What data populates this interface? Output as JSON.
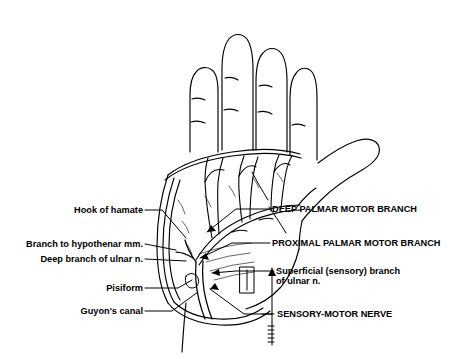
{
  "figure": {
    "background_color": "#ffffff",
    "line_color": "#000000"
  },
  "labels": {
    "left": [
      {
        "id": "hook-of-hamate",
        "text": "Hook of hamate"
      },
      {
        "id": "branch-to-hypothenar",
        "text": "Branch to hypothenar mm."
      },
      {
        "id": "deep-branch-of-ulnar-nerve",
        "text": "Deep branch of ulnar n."
      },
      {
        "id": "pisiform",
        "text": "Pisiform"
      },
      {
        "id": "guyons-canal",
        "text": "Guyon's canal"
      }
    ],
    "right": [
      {
        "id": "deep-palmar-motor-branch",
        "text": "DEEP PALMAR MOTOR BRANCH"
      },
      {
        "id": "proximal-palmar-motor-branch",
        "text": "PROXIMAL PALMAR MOTOR BRANCH"
      },
      {
        "id": "superficial-sensory-branch-line1",
        "text": "Superficial (sensory) branch"
      },
      {
        "id": "superficial-sensory-branch-line2",
        "text": "of ulnar n."
      },
      {
        "id": "sensory-motor-nerve",
        "text": "SENSORY-MOTOR NERVE"
      }
    ]
  }
}
